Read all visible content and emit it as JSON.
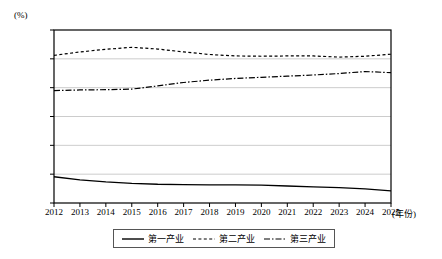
{
  "chart_data": {
    "type": "line",
    "title": "",
    "xlabel": "(年份)",
    "ylabel": "(%)",
    "x": [
      2012,
      2013,
      2014,
      2015,
      2016,
      2017,
      2018,
      2019,
      2020,
      2021,
      2022,
      2023,
      2024,
      2025
    ],
    "categories": [
      "2012",
      "2013",
      "2014",
      "2015",
      "2016",
      "2017",
      "2018",
      "2019",
      "2020",
      "2021",
      "2022",
      "2023",
      "2024",
      "2025"
    ],
    "ylim": [
      0,
      60
    ],
    "yticks": [
      0,
      10,
      20,
      30,
      40,
      50,
      60
    ],
    "ytick_labels": [
      "0",
      "10.00",
      "20.00",
      "30.00",
      "40.00",
      "50.00",
      "60.00"
    ],
    "grid": true,
    "legend_position": "bottom",
    "series": [
      {
        "name": "第一产业",
        "style": "solid",
        "color": "#000000",
        "values": [
          9.1,
          8.0,
          7.3,
          6.8,
          6.5,
          6.4,
          6.3,
          6.3,
          6.2,
          5.9,
          5.6,
          5.3,
          4.9,
          4.2
        ]
      },
      {
        "name": "第二产业",
        "style": "dotted",
        "color": "#000000",
        "values": [
          51.2,
          52.4,
          53.3,
          54.0,
          53.4,
          52.4,
          51.5,
          51.0,
          50.9,
          51.0,
          51.0,
          50.6,
          50.9,
          51.6
        ]
      },
      {
        "name": "第三产业",
        "style": "dashdot",
        "color": "#000000",
        "values": [
          39.0,
          39.2,
          39.3,
          39.5,
          40.6,
          41.8,
          42.6,
          43.2,
          43.6,
          44.0,
          44.4,
          44.9,
          45.6,
          45.2
        ]
      }
    ]
  },
  "legend": {
    "items": [
      {
        "label": "第一产业",
        "style": "solid"
      },
      {
        "label": "第二产业",
        "style": "dotted"
      },
      {
        "label": "第三产业",
        "style": "dashdot"
      }
    ]
  }
}
